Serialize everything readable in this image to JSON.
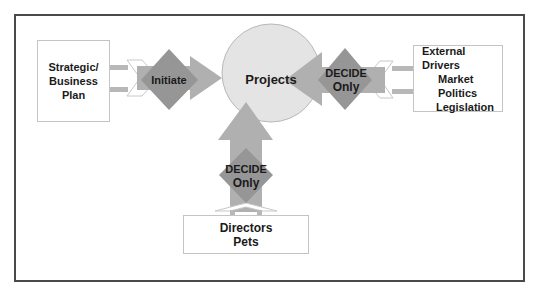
{
  "diagram": {
    "center_node": {
      "label": "Projects"
    },
    "sources": [
      {
        "id": "strategic",
        "lines": [
          "Strategic/",
          "Business Plan"
        ],
        "position": "left"
      },
      {
        "id": "external",
        "lines": [
          "External Drivers",
          "Market",
          "Politics",
          "Legislation"
        ],
        "position": "right"
      },
      {
        "id": "directors",
        "lines": [
          "Directors",
          "Pets"
        ],
        "position": "bottom"
      }
    ],
    "gates": [
      {
        "id": "initiate",
        "lines": [
          "Initiate"
        ],
        "from": "strategic",
        "to": "Projects"
      },
      {
        "id": "decide-right",
        "lines": [
          "DECIDE",
          "Only"
        ],
        "from": "external",
        "to": "Projects"
      },
      {
        "id": "decide-bottom",
        "lines": [
          "DECIDE",
          "Only"
        ],
        "from": "directors",
        "to": "Projects"
      }
    ]
  },
  "colors": {
    "frame": "#4a4a4a",
    "circle_fill": "#e4e4e4",
    "circle_stroke": "#b8b8b8",
    "arrow_fill": "#b0b0b0",
    "diamond_fill": "#969696",
    "connector_fill": "#b8b8b8",
    "box_border": "#c4c4c4",
    "text": "#1a1a1a"
  }
}
